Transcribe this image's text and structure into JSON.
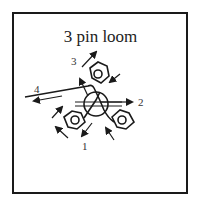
{
  "diagram": {
    "title": "3 pin loom",
    "labels": [
      {
        "id": "1",
        "text": "1"
      },
      {
        "id": "2",
        "text": "2"
      },
      {
        "id": "3",
        "text": "3"
      },
      {
        "id": "4",
        "text": "4"
      }
    ]
  }
}
